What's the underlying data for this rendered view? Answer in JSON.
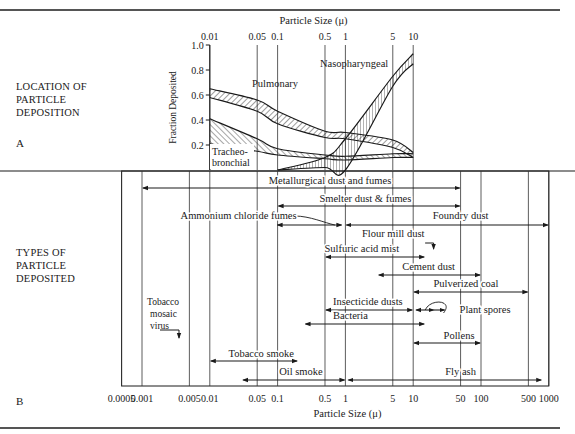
{
  "section_labels": {
    "a_heading_lines": [
      "LOCATION OF",
      "PARTICLE",
      "DEPOSITION"
    ],
    "a_letter": "A",
    "b_heading_lines": [
      "TYPES OF",
      "PARTICLE",
      "DEPOSITED"
    ],
    "b_letter": "B"
  },
  "chart_data": [
    {
      "type": "area",
      "title": "Location of Particle Deposition",
      "xlabel": "Particle Size (μ)",
      "ylabel": "Fraction Deposited",
      "x_scale": "log",
      "xlim": [
        0.01,
        10
      ],
      "ylim": [
        0,
        1.0
      ],
      "x_ticks": [
        "0.01",
        "0.05",
        "0.1",
        "0.5",
        "1",
        "5",
        "10"
      ],
      "y_ticks": [
        "0.2",
        "0.4",
        "0.6",
        "0.8",
        "1.0"
      ],
      "grid": "vertical lines at x ticks",
      "series": [
        {
          "name": "Pulmonary",
          "x": [
            0.01,
            0.05,
            0.1,
            0.5,
            1,
            5,
            10
          ],
          "upper": [
            0.65,
            0.56,
            0.47,
            0.31,
            0.3,
            0.24,
            0.14
          ],
          "lower": [
            0.58,
            0.47,
            0.37,
            0.26,
            0.25,
            0.18,
            0.1
          ]
        },
        {
          "name": "Tracheo-bronchial",
          "x": [
            0.01,
            0.05,
            0.1,
            0.5,
            1,
            5,
            10
          ],
          "upper": [
            0.41,
            0.25,
            0.17,
            0.12,
            0.11,
            0.13,
            0.13
          ],
          "lower": [
            0.21,
            0.15,
            0.12,
            0.09,
            0.08,
            0.1,
            0.1
          ]
        },
        {
          "name": "Nasopharyngeal",
          "x": [
            0.1,
            0.5,
            1,
            5,
            10
          ],
          "upper": [
            0.0,
            0.1,
            0.25,
            0.75,
            0.93
          ],
          "lower": [
            0.0,
            0.02,
            0.0,
            0.67,
            0.85
          ]
        }
      ]
    },
    {
      "type": "range-bars",
      "title": "Types of Particle Deposited",
      "xlabel": "Particle Size (μ)",
      "x_scale": "log",
      "xlim": [
        0.0005,
        1000
      ],
      "x_ticks": [
        "0.0005",
        "0.001",
        "0.005",
        "0.01",
        "0.05",
        "0.1",
        "0.5",
        "1",
        "5",
        "10",
        "50",
        "100",
        "500",
        "1000"
      ],
      "ranges": [
        {
          "name": "Metallurgical dust and fumes",
          "min": 0.001,
          "max": 50
        },
        {
          "name": "Smelter dust & fumes",
          "min": 0.1,
          "max": 50
        },
        {
          "name": "Ammonium chloride fumes",
          "min": 0.1,
          "max": 1
        },
        {
          "name": "Foundry dust",
          "min": 1,
          "max": 1000
        },
        {
          "name": "Flour mill dust",
          "min": 15,
          "max": 20
        },
        {
          "name": "Sulfuric acid mist",
          "min": 0.5,
          "max": 15
        },
        {
          "name": "Cement dust",
          "min": 3,
          "max": 100
        },
        {
          "name": "Pulverized coal",
          "min": 10,
          "max": 500
        },
        {
          "name": "Insecticide dusts",
          "min": 0.5,
          "max": 10
        },
        {
          "name": "Plant spores",
          "min": 10,
          "max": 30
        },
        {
          "name": "Bacteria",
          "min": 0.25,
          "max": 15
        },
        {
          "name": "Tobacco mosaic virus",
          "min": 0.004,
          "max": 0.004
        },
        {
          "name": "Pollens",
          "min": 10,
          "max": 100
        },
        {
          "name": "Tobacco smoke",
          "min": 0.01,
          "max": 0.2
        },
        {
          "name": "Oil smoke",
          "min": 0.03,
          "max": 1
        },
        {
          "name": "Fly ash",
          "min": 1,
          "max": 800
        }
      ]
    }
  ]
}
